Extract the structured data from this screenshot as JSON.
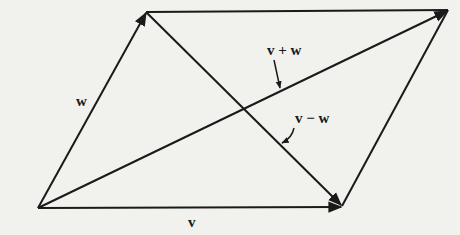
{
  "diagram": {
    "background": "#f1f1ee",
    "stroke": "#1a1a1a",
    "labels": {
      "w": "w",
      "v": "v",
      "sum": "v + w",
      "diff": "v − w"
    },
    "points": {
      "origin": [
        38,
        208
      ],
      "w_tip": [
        146,
        12
      ],
      "v_tip": [
        342,
        206
      ],
      "sum_tip": [
        448,
        10
      ]
    }
  }
}
